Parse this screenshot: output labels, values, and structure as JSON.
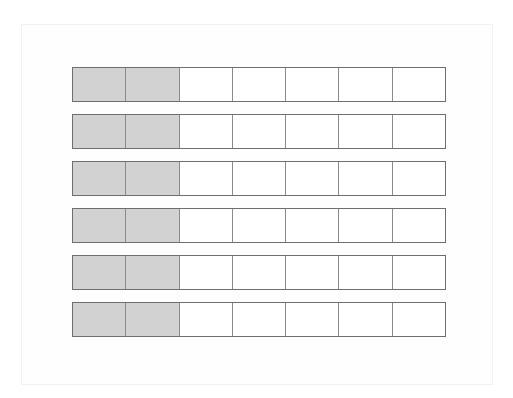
{
  "figure": {
    "background_color": "#ffffff",
    "frame": {
      "border_color": "#f1f2f4",
      "x": 21,
      "y": 24,
      "width": 472,
      "height": 361
    },
    "geometry": {
      "bar_left": 72,
      "bar_top": 67,
      "bar_width": 374,
      "bar_height": 35,
      "row_pitch": 47,
      "cell_width": 53.4
    },
    "colors": {
      "shaded_fill": "#d2d2d2",
      "unshaded_fill": "#ffffff",
      "cell_border": "#8a8a8a",
      "bar_outline": "#7a7a7a"
    },
    "cells_per_bar": 7,
    "shaded_per_bar": 2,
    "bar_count": 6,
    "bars": [
      {
        "index": 1,
        "label": "bar-1",
        "y": 0,
        "cells": [
          "shaded",
          "shaded",
          "empty",
          "empty",
          "empty",
          "empty",
          "empty"
        ]
      },
      {
        "index": 2,
        "label": "bar-2",
        "y": 47,
        "cells": [
          "shaded",
          "shaded",
          "empty",
          "empty",
          "empty",
          "empty",
          "empty"
        ]
      },
      {
        "index": 3,
        "label": "bar-3",
        "y": 94,
        "cells": [
          "shaded",
          "shaded",
          "empty",
          "empty",
          "empty",
          "empty",
          "empty"
        ]
      },
      {
        "index": 4,
        "label": "bar-4",
        "y": 141,
        "cells": [
          "shaded",
          "shaded",
          "empty",
          "empty",
          "empty",
          "empty",
          "empty"
        ]
      },
      {
        "index": 5,
        "label": "bar-5",
        "y": 188,
        "cells": [
          "shaded",
          "shaded",
          "empty",
          "empty",
          "empty",
          "empty",
          "empty"
        ]
      },
      {
        "index": 6,
        "label": "bar-6",
        "y": 235,
        "cells": [
          "shaded",
          "shaded",
          "empty",
          "empty",
          "empty",
          "empty",
          "empty"
        ]
      }
    ]
  },
  "chart_data": {
    "type": "bar",
    "title": "",
    "xlabel": "",
    "ylabel": "",
    "categories": [
      "bar-1",
      "bar-2",
      "bar-3",
      "bar-4",
      "bar-5",
      "bar-6"
    ],
    "values": [
      2,
      2,
      2,
      2,
      2,
      2
    ],
    "total_per_category": 7,
    "fraction_shaded": "2/7",
    "ylim": [
      0,
      7
    ],
    "grid": false,
    "legend": "none"
  }
}
